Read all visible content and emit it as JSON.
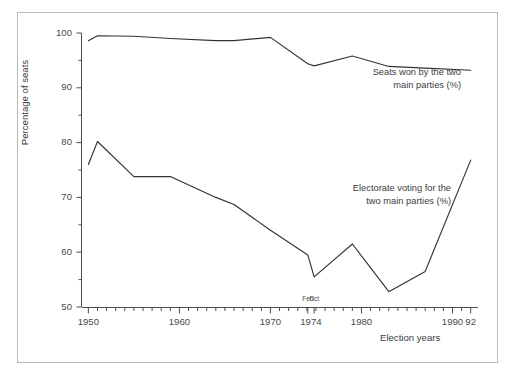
{
  "figure": {
    "background_color": "#ffffff",
    "frame_color": "#b9b9b9",
    "line_color": "#333333"
  },
  "axes": {
    "ylabel": "Percentage of seats",
    "xlabel": "Election years",
    "ytick_labels": [
      "100",
      "90",
      "80",
      "70",
      "60",
      "50"
    ],
    "xtick_labels": [
      "1950",
      "1960",
      "1970",
      "1974",
      "1980",
      "1990",
      "92"
    ],
    "sub_tick_labels": [
      "Feb",
      "Oct"
    ]
  },
  "annotations": {
    "seats": "Seats won by the two\nmain parties (%)",
    "electorate": "Electorate voting for the\ntwo main parties (%)"
  },
  "chart_data": {
    "type": "line",
    "title": "",
    "xlabel": "Election years",
    "ylabel": "Percentage of seats",
    "xlim": [
      1949.3,
      1992.8
    ],
    "ylim": [
      50,
      100
    ],
    "yticks": [
      50,
      60,
      70,
      80,
      90,
      100
    ],
    "yminor_step": 5,
    "xticks": [
      1950,
      1960,
      1970,
      1974,
      1980,
      1990,
      1992
    ],
    "xminor_step": 1,
    "grid": false,
    "legend": "inline-annotations",
    "x": [
      1950,
      1951,
      1955,
      1959,
      1964,
      1966,
      1970,
      1974.1,
      1974.8,
      1979,
      1983,
      1987,
      1992
    ],
    "series": [
      {
        "name": "Seats won by the two main parties (%)",
        "label_position": "above-right",
        "values": [
          98.6,
          99.5,
          99.4,
          99.0,
          98.6,
          98.6,
          99.2,
          94.4,
          94.0,
          95.8,
          93.9,
          93.6,
          93.2
        ]
      },
      {
        "name": "Electorate voting for the two main parties (%)",
        "label_position": "center-right",
        "values": [
          76.0,
          80.2,
          73.8,
          73.8,
          70.0,
          68.7,
          64.0,
          59.5,
          55.5,
          61.5,
          52.8,
          56.5,
          76.8
        ]
      }
    ]
  }
}
